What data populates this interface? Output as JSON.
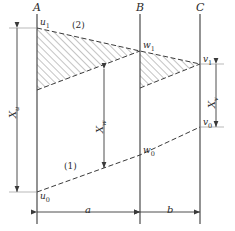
{
  "figure": {
    "type": "engineering-line-diagram",
    "background_color": "#ffffff",
    "line_color": "#3a3a3a",
    "hatch_color": "#555555",
    "label_color": "#2b2b2b",
    "width": 235,
    "height": 231
  },
  "stations": [
    {
      "id": "A",
      "label": "A",
      "x": 37
    },
    {
      "id": "B",
      "label": "B",
      "x": 140
    },
    {
      "id": "C",
      "label": "C",
      "x": 200
    }
  ],
  "points": [
    {
      "id": "u1",
      "label": "u",
      "sub": "1",
      "station": "A",
      "x": 37,
      "y": 28
    },
    {
      "id": "u0",
      "label": "u",
      "sub": "0",
      "station": "A",
      "x": 37,
      "y": 192
    },
    {
      "id": "w1",
      "label": "w",
      "sub": "1",
      "station": "B",
      "x": 140,
      "y": 51
    },
    {
      "id": "w0",
      "label": "w",
      "sub": "0",
      "station": "B",
      "x": 140,
      "y": 155
    },
    {
      "id": "v1",
      "label": "v",
      "sub": "1",
      "station": "C",
      "x": 200,
      "y": 64
    },
    {
      "id": "v0",
      "label": "v",
      "sub": "0",
      "station": "C",
      "x": 200,
      "y": 127
    }
  ],
  "curves": [
    {
      "id": "curve-1",
      "label": "(1)",
      "style": "dashed",
      "label_x": 64,
      "label_y": 167
    },
    {
      "id": "curve-2",
      "label": "(2)",
      "style": "dashed",
      "label_x": 72,
      "label_y": 27
    }
  ],
  "dimensions": [
    {
      "id": "Xu",
      "label": "X",
      "sub": "u",
      "orientation": "vertical",
      "from": "u1",
      "to": "u0"
    },
    {
      "id": "Xw",
      "label": "X",
      "sub": "w",
      "orientation": "vertical",
      "from": "w1-line",
      "to": "w0-line"
    },
    {
      "id": "Xv",
      "label": "X",
      "sub": "v",
      "orientation": "vertical",
      "from": "v1",
      "to": "v0"
    },
    {
      "id": "a",
      "label": "a",
      "sub": "",
      "orientation": "horizontal",
      "from": "A",
      "to": "B"
    },
    {
      "id": "b",
      "label": "b",
      "sub": "",
      "orientation": "horizontal",
      "from": "B",
      "to": "C"
    }
  ],
  "hatched_regions": [
    {
      "id": "region-AB",
      "between": [
        "A",
        "B"
      ],
      "note": "upper wedge between curve (2) and lower chord"
    },
    {
      "id": "region-BC",
      "between": [
        "B",
        "C"
      ],
      "note": "upper wedge between curve (2) and lower chord"
    }
  ]
}
